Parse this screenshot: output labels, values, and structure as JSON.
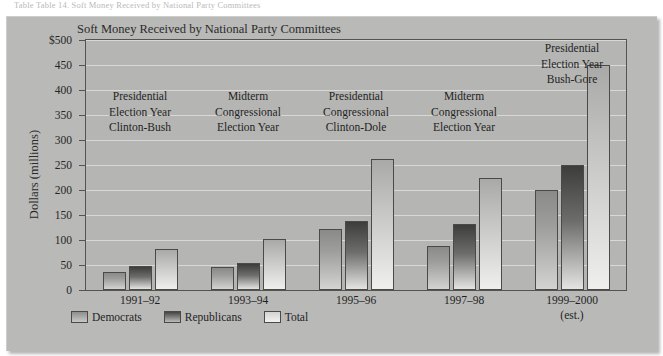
{
  "caption_line": "Table  Table 14. Soft Money Received by National Party Committees",
  "chart_title": "Soft Money Received by National Party Committees",
  "y_axis_title": "Dollars (millions)",
  "legend": [
    {
      "key": "democrats",
      "label": "Democrats"
    },
    {
      "key": "republicans",
      "label": "Republicans"
    },
    {
      "key": "total",
      "label": "Total"
    }
  ],
  "annotations": [
    {
      "name": "annot-1991-92",
      "lines": [
        "Presidential",
        "Election Year",
        "Clinton-Bush"
      ]
    },
    {
      "name": "annot-1993-94",
      "lines": [
        "Midterm",
        "Congressional",
        "Election Year"
      ]
    },
    {
      "name": "annot-1995-96",
      "lines": [
        "Presidential",
        "Congressional",
        "Clinton-Dole"
      ]
    },
    {
      "name": "annot-1997-98",
      "lines": [
        "Midterm",
        "Congressional",
        "Election Year"
      ]
    },
    {
      "name": "annot-1999-2000",
      "lines": [
        "Presidential",
        "Election Year",
        "Bush-Gore"
      ]
    }
  ],
  "est_note": "(est.)",
  "chart_data": {
    "type": "bar",
    "title": "Soft Money Received by National Party Committees",
    "xlabel": "",
    "ylabel": "Dollars (millions)",
    "ylim": [
      0,
      500
    ],
    "yticks": [
      "0",
      "50",
      "100",
      "150",
      "200",
      "250",
      "300",
      "350",
      "400",
      "450",
      "$500"
    ],
    "grid": true,
    "legend_position": "bottom-left",
    "categories": [
      "1991–92",
      "1993–94",
      "1995–96",
      "1997–98",
      "1999–2000"
    ],
    "series": [
      {
        "name": "Democrats",
        "values": [
          36,
          46,
          123,
          88,
          200
        ]
      },
      {
        "name": "Republicans",
        "values": [
          48,
          55,
          138,
          132,
          250
        ]
      },
      {
        "name": "Total",
        "values": [
          83,
          102,
          262,
          225,
          450
        ]
      }
    ]
  },
  "colors": {
    "panel_background": "#b9b9b7",
    "plot_background": "#b5b5b3",
    "gridline": "#d8d8d6",
    "axis": "#55534f",
    "text": "#1f1f1f",
    "democrats": "#9d9d9b",
    "republicans": "#6d6d6b",
    "total": "#d3d3d1"
  }
}
